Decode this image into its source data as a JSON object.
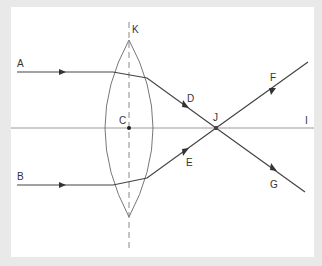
{
  "diagram": {
    "labels": {
      "A": "A",
      "B": "B",
      "C": "C",
      "D": "D",
      "E": "E",
      "F": "F",
      "G": "G",
      "I": "I",
      "J": "J",
      "K": "K"
    },
    "colors": {
      "background": "#e9e9e9",
      "panel": "#ffffff",
      "ray": "#444444",
      "axis": "#999999",
      "lens": "#777777"
    }
  }
}
